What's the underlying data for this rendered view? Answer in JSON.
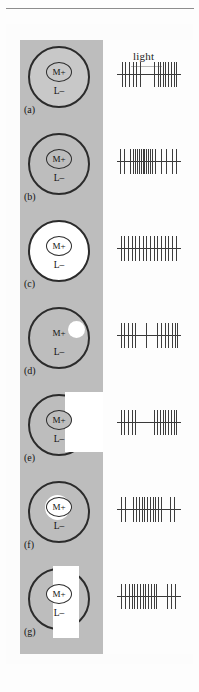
{
  "figure": {
    "stimulus_label_light": "light",
    "center_label": "M+",
    "surround_label": "L–",
    "colors": {
      "background": "#fdfdfd",
      "grey_surround": "#bdbdbd",
      "light_white": "#ffffff",
      "outline": "#2b2b2b",
      "spike": "#3d3d3d"
    }
  },
  "panels": [
    {
      "tag": "(a)",
      "center_label": "M+",
      "surround_label": "L–",
      "stimulus": "uniform dim field over whole receptive field",
      "outer_fill": "fill-lgrey",
      "center_fill": "c-lgrey",
      "overlay": "none",
      "response": "burst at onset and larger burst at offset, silent during light",
      "spikes_ms": [
        5,
        9,
        13,
        17,
        21,
        25,
        41,
        45,
        47,
        50,
        53,
        56,
        59,
        62,
        64
      ],
      "spike_heights": [
        25,
        25,
        25,
        25,
        25,
        25,
        25,
        25,
        25,
        25,
        25,
        25,
        25,
        25,
        25
      ]
    },
    {
      "tag": "(b)",
      "center_label": "M+",
      "surround_label": "L–",
      "stimulus": "uniform grey field matching background",
      "outer_fill": "fill-grey",
      "center_fill": "c-grey",
      "overlay": "none",
      "response": "sustained high-frequency burst through middle of trace",
      "spikes_ms": [
        3,
        8,
        14,
        17,
        20,
        22,
        24,
        26,
        28,
        30,
        32,
        34,
        36,
        38,
        42,
        48,
        54,
        60,
        64
      ],
      "spike_heights": [
        25,
        25,
        25,
        25,
        25,
        25,
        25,
        25,
        25,
        25,
        25,
        25,
        25,
        25,
        25,
        25,
        25,
        25,
        25
      ]
    },
    {
      "tag": "(c)",
      "center_label": "M+",
      "surround_label": "L–",
      "stimulus": "whole receptive field illuminated",
      "outer_fill": "fill-white",
      "center_fill": "c-white",
      "overlay": "none",
      "response": "regular evenly spaced maintained discharge",
      "spikes_ms": [
        4,
        8,
        12,
        16,
        20,
        24,
        28,
        32,
        36,
        40,
        44,
        48,
        52,
        56,
        60,
        64
      ],
      "spike_heights": [
        25,
        25,
        25,
        25,
        25,
        25,
        25,
        25,
        25,
        25,
        25,
        25,
        25,
        25,
        25,
        25
      ]
    },
    {
      "tag": "(d)",
      "center_label": "M+",
      "surround_label": "L–",
      "stimulus": "small spot of light on surround only",
      "outer_fill": "fill-grey",
      "center_fill": "c-none",
      "overlay": "spot",
      "response": "onset burst then pause then offset burst",
      "spikes_ms": [
        4,
        8,
        12,
        16,
        20,
        32,
        44,
        48,
        52,
        56,
        60,
        63,
        66
      ],
      "spike_heights": [
        25,
        25,
        25,
        25,
        25,
        25,
        25,
        25,
        25,
        25,
        25,
        25,
        25
      ]
    },
    {
      "tag": "(e)",
      "center_label": "M+",
      "surround_label": "L–",
      "stimulus": "half field of light covering right side of receptive field",
      "outer_fill": "fill-grey",
      "center_fill": "c-grey",
      "overlay": "halfrect",
      "response": "short onset burst, silence, then strong offset burst",
      "spikes_ms": [
        4,
        8,
        12,
        16,
        20,
        40,
        44,
        47,
        50,
        53,
        56,
        59,
        62,
        65
      ],
      "spike_heights": [
        25,
        25,
        25,
        25,
        25,
        25,
        25,
        25,
        25,
        25,
        25,
        25,
        25,
        25
      ]
    },
    {
      "tag": "(f)",
      "center_label": "M+",
      "surround_label": "L–",
      "stimulus": "spot of light centred on M+ centre only",
      "outer_fill": "fill-grey",
      "center_fill": "c-white",
      "overlay": "centerdisc",
      "response": "dense sustained burst during light with trailing spikes",
      "spikes_ms": [
        4,
        9,
        18,
        21,
        24,
        27,
        30,
        33,
        36,
        39,
        42,
        45,
        48,
        58,
        62
      ],
      "spike_heights": [
        25,
        25,
        25,
        25,
        25,
        25,
        25,
        25,
        25,
        25,
        25,
        25,
        25,
        25,
        25
      ]
    },
    {
      "tag": "(g)",
      "center_label": "M+",
      "surround_label": "L–",
      "stimulus": "vertical bar of light through centre of receptive field",
      "outer_fill": "fill-grey",
      "center_fill": "c-white",
      "overlay": "bar",
      "response": "sustained burst during bar presentation then brief late spikes",
      "spikes_ms": [
        4,
        9,
        13,
        16,
        19,
        22,
        25,
        28,
        31,
        34,
        37,
        40,
        43,
        55,
        59,
        63
      ],
      "spike_heights": [
        25,
        25,
        25,
        25,
        25,
        25,
        25,
        25,
        25,
        25,
        25,
        25,
        25,
        25,
        25,
        25
      ]
    }
  ]
}
